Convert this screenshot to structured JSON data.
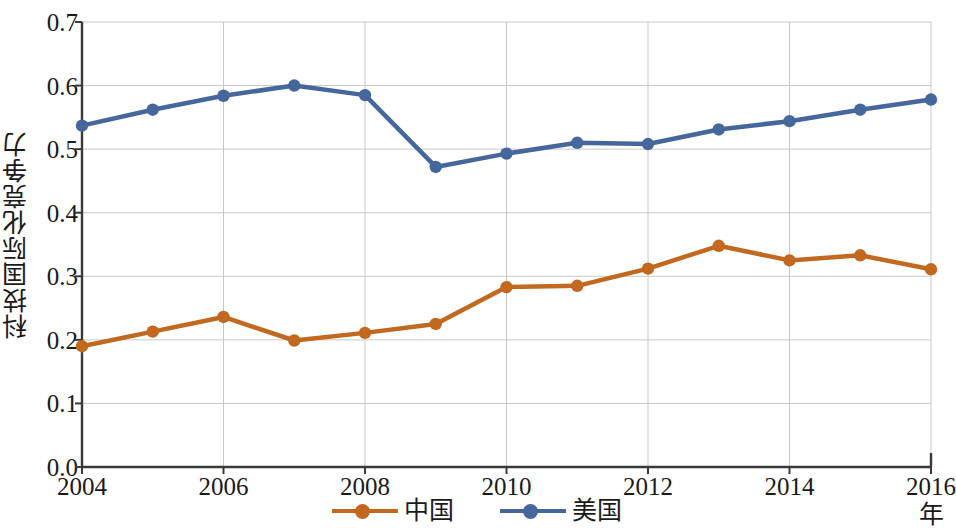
{
  "chart_data": {
    "type": "line",
    "title": "",
    "xlabel": "年",
    "ylabel": "科技国际化竞争力",
    "x": [
      2004,
      2005,
      2006,
      2007,
      2008,
      2009,
      2010,
      2011,
      2012,
      2013,
      2014,
      2015,
      2016
    ],
    "xtick_labels": [
      "2004",
      "2006",
      "2008",
      "2010",
      "2012",
      "2014",
      "2016"
    ],
    "xtick_values": [
      2004,
      2006,
      2008,
      2010,
      2012,
      2014,
      2016
    ],
    "xlim": [
      2004,
      2016
    ],
    "ytick_labels": [
      "0.0",
      "0.1",
      "0.2",
      "0.3",
      "0.4",
      "0.5",
      "0.6",
      "0.7"
    ],
    "ytick_values": [
      0.0,
      0.1,
      0.2,
      0.3,
      0.4,
      0.5,
      0.6,
      0.7
    ],
    "ylim": [
      0.0,
      0.7
    ],
    "grid": true,
    "legend_position": "bottom-center",
    "series": [
      {
        "name": "中国",
        "color": "#c2681f",
        "marker": "circle",
        "values": [
          0.19,
          0.213,
          0.236,
          0.199,
          0.211,
          0.225,
          0.283,
          0.285,
          0.312,
          0.348,
          0.325,
          0.333,
          0.311
        ]
      },
      {
        "name": "美国",
        "color": "#45679c",
        "marker": "circle",
        "values": [
          0.537,
          0.562,
          0.584,
          0.6,
          0.585,
          0.472,
          0.493,
          0.51,
          0.508,
          0.531,
          0.544,
          0.562,
          0.578
        ]
      }
    ]
  },
  "legend": {
    "items": [
      {
        "label": "中国",
        "color": "#c2681f"
      },
      {
        "label": "美国",
        "color": "#45679c"
      }
    ]
  },
  "style": {
    "axis_color": "#3a3a3a",
    "grid_color": "#c9c9c4",
    "background": "#ffffff",
    "china_color": "#c2681f",
    "usa_color": "#45679c"
  }
}
